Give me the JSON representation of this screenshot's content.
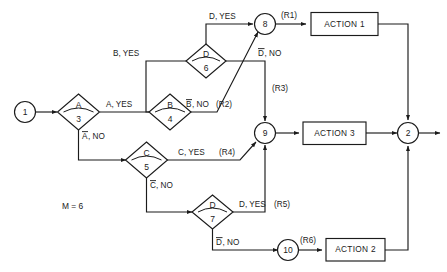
{
  "diagram": {
    "note": "M = 6",
    "stroke_color": "#1b1b1b",
    "background_color": "#ffffff"
  },
  "nodes": {
    "start": {
      "label": "1",
      "shape": "circle"
    },
    "exit": {
      "label": "2",
      "shape": "circle"
    },
    "d3": {
      "condition": "A",
      "number": "3",
      "shape": "diamond"
    },
    "d4": {
      "condition": "B",
      "number": "4",
      "shape": "diamond"
    },
    "d5": {
      "condition": "C",
      "number": "5",
      "shape": "diamond"
    },
    "d6": {
      "condition": "D",
      "number": "6",
      "shape": "diamond"
    },
    "d7": {
      "condition": "D",
      "number": "7",
      "shape": "diamond"
    },
    "j8": {
      "label": "8",
      "shape": "circle"
    },
    "j9": {
      "label": "9",
      "shape": "circle"
    },
    "j10": {
      "label": "10",
      "shape": "circle"
    }
  },
  "boxes": {
    "action1": {
      "label": "ACTION 1"
    },
    "action3": {
      "label": "ACTION 3"
    },
    "action2": {
      "label": "ACTION 2"
    }
  },
  "edge_labels": {
    "a_yes": "A, YES",
    "a_no_pre": "A",
    "a_no_post": ", NO",
    "b_yes": "B, YES",
    "b_no_pre": "B",
    "b_no_post": ", NO",
    "c_yes": "C, YES",
    "c_no_pre": "C",
    "c_no_post": ", NO",
    "d_yes_top": "D, YES",
    "d_no_mid_pre": "D",
    "d_no_mid_post": ", NO",
    "d_yes_bottom": "D, YES",
    "d_no_bottom_pre": "D",
    "d_no_bottom_post": ", NO"
  },
  "rules": {
    "r1": "(R1)",
    "r2": "(R2)",
    "r3": "(R3)",
    "r4": "(R4)",
    "r5": "(R5)",
    "r6": "(R6)"
  }
}
